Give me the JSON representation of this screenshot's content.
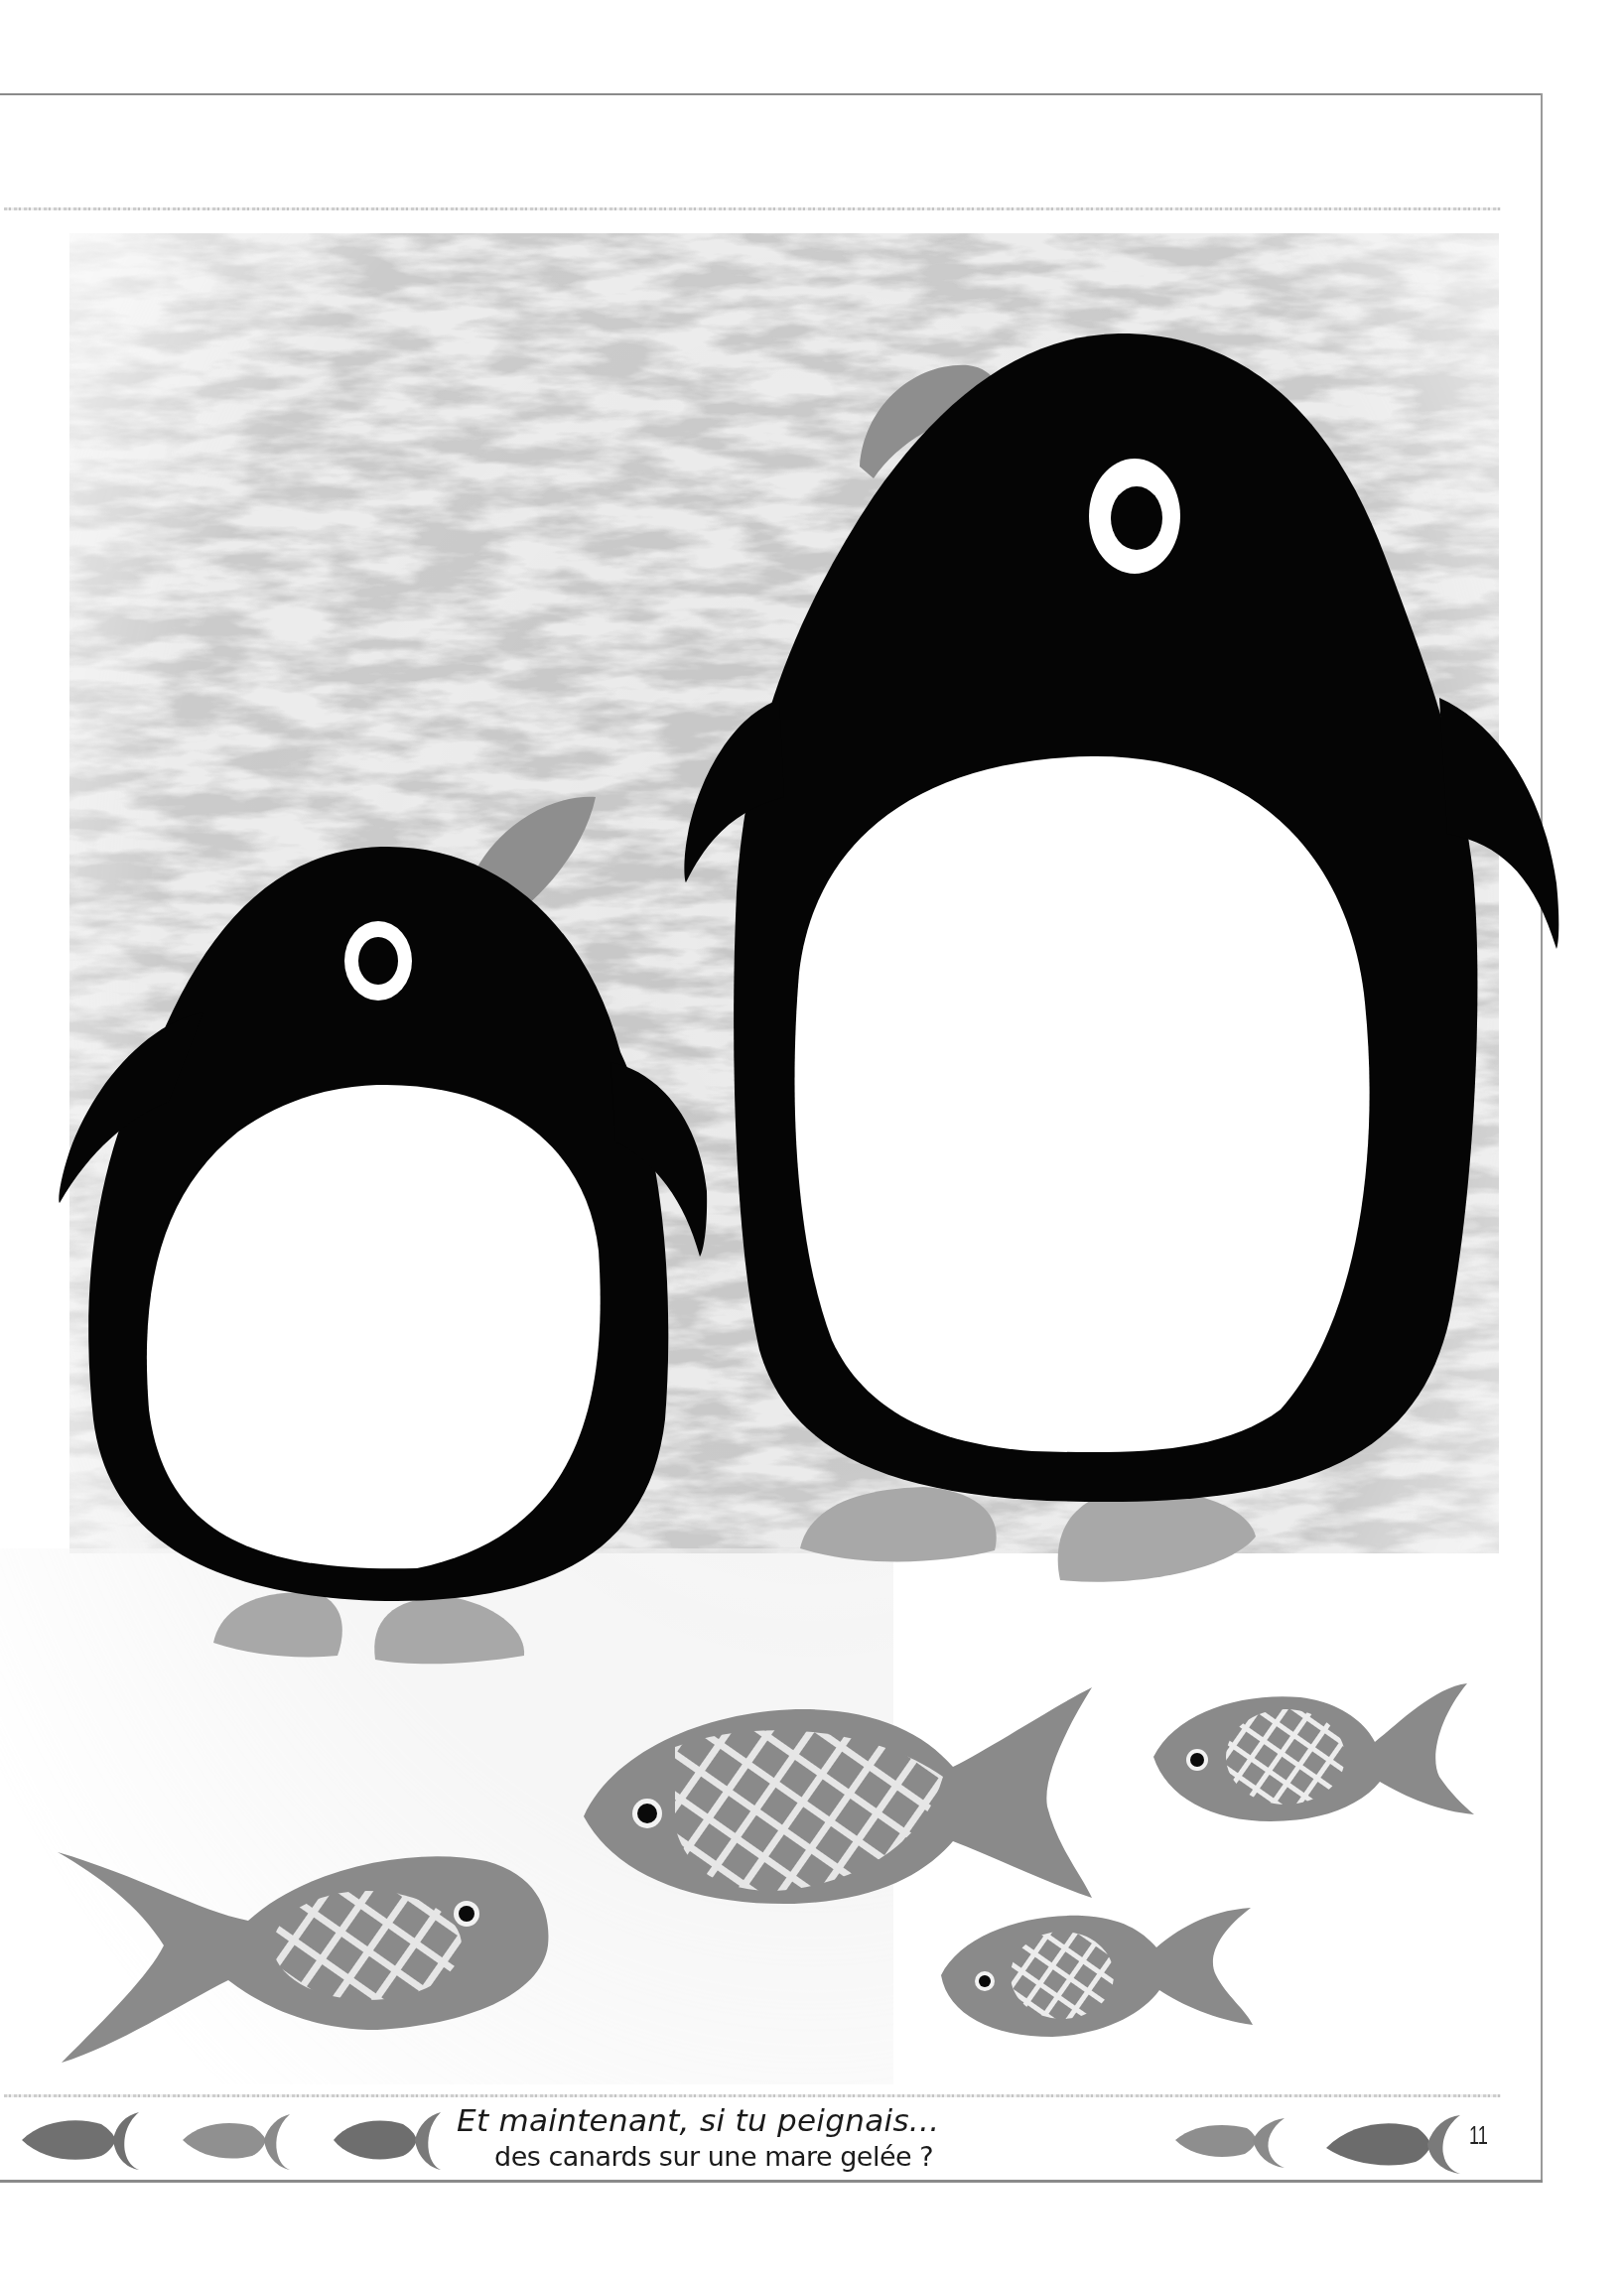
{
  "page": {
    "number": "11",
    "caption_line_1": "Et maintenant, si tu peignais...",
    "caption_line_2": "des canards sur une mare gelée ?"
  },
  "illustration": {
    "subject": "two penguins on ice with five crosshatched fish",
    "penguins": [
      {
        "name": "small-penguin",
        "body_color": "#050505",
        "belly_color": "#ffffff",
        "beak_color": "#8e8e8e",
        "feet_color": "#a8a8a8"
      },
      {
        "name": "big-penguin",
        "body_color": "#050505",
        "belly_color": "#ffffff",
        "beak_color": "#8e8e8e",
        "feet_color": "#a8a8a8"
      }
    ],
    "fish": [
      {
        "name": "fish-bottom-left",
        "facing": "right",
        "color": "#8a8a8a"
      },
      {
        "name": "fish-middle-large",
        "facing": "left",
        "color": "#8a8a8a"
      },
      {
        "name": "fish-upper-right",
        "facing": "left",
        "color": "#8a8a8a"
      },
      {
        "name": "fish-lower-right-small",
        "facing": "left",
        "color": "#8a8a8a"
      }
    ],
    "ice_texture_color": "#b4b4b4"
  },
  "footer": {
    "fish_icons": [
      {
        "color": "#707070"
      },
      {
        "color": "#909090"
      },
      {
        "color": "#6e6e6e"
      },
      {
        "color": "#8e8e8e"
      },
      {
        "color": "#6c6c6c"
      }
    ]
  }
}
